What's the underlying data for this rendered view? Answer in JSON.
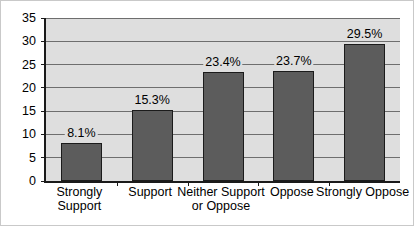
{
  "chart_data": {
    "type": "bar",
    "title": "",
    "subtitle": "",
    "xlabel": "",
    "ylabel": "",
    "ylim": [
      0,
      35
    ],
    "ytick_step": 5,
    "yticks": [
      "0",
      "5",
      "10",
      "15",
      "20",
      "25",
      "30",
      "35"
    ],
    "grid": true,
    "legend": false,
    "categories": [
      "Strongly Support",
      "Support",
      "Neither Support or Oppose",
      "Oppose",
      "Strongly Oppose"
    ],
    "category_lines": [
      [
        "Strongly",
        "Support"
      ],
      [
        "Support",
        ""
      ],
      [
        "Neither Support",
        "or Oppose"
      ],
      [
        "Oppose",
        ""
      ],
      [
        "Strongly Oppose",
        ""
      ]
    ],
    "values": [
      8.1,
      15.3,
      23.4,
      23.7,
      29.5
    ],
    "data_labels": [
      "8.1%",
      "15.3%",
      "23.4%",
      "23.7%",
      "29.5%"
    ],
    "colors": {
      "bar_fill": "#5c5c5c",
      "bar_outline": "#1b1b1b",
      "plot_background": "#dedede",
      "gridline": "#6e6e6e",
      "axis": "#1a1a1a",
      "text": "#000000",
      "figure_background": "#ffffff",
      "figure_border": "#c9c9c9"
    }
  }
}
